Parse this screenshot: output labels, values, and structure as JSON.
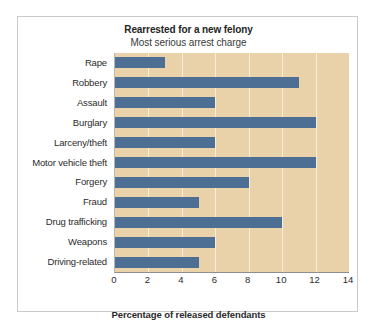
{
  "chart_data": {
    "type": "bar",
    "orientation": "horizontal",
    "title": "Rearrested for a new felony",
    "subtitle": "Most serious arrest charge",
    "xlabel": "Percentage of released defendants",
    "ylabel": "",
    "xlim": [
      0,
      14
    ],
    "xticks": [
      0,
      2,
      4,
      6,
      8,
      10,
      12,
      14
    ],
    "xtick_labels": [
      "0",
      "2",
      "4",
      "6",
      "8",
      "10",
      "12",
      "14"
    ],
    "grid": "vertical",
    "legend": "none",
    "categories": [
      "Rape",
      "Robbery",
      "Assault",
      "Burglary",
      "Larceny/theft",
      "Motor vehicle theft",
      "Forgery",
      "Fraud",
      "Drug trafficking",
      "Weapons",
      "Driving-related"
    ],
    "values": [
      3,
      11,
      6,
      12,
      6,
      12,
      8,
      5,
      10,
      6,
      5
    ],
    "bars": [
      {
        "category": "Rape",
        "value": 3
      },
      {
        "category": "Robbery",
        "value": 11
      },
      {
        "category": "Assault",
        "value": 6
      },
      {
        "category": "Burglary",
        "value": 12
      },
      {
        "category": "Larceny/theft",
        "value": 6
      },
      {
        "category": "Motor vehicle theft",
        "value": 12
      },
      {
        "category": "Forgery",
        "value": 8
      },
      {
        "category": "Fraud",
        "value": 5
      },
      {
        "category": "Drug trafficking",
        "value": 10
      },
      {
        "category": "Weapons",
        "value": 6
      },
      {
        "category": "Driving-related",
        "value": 5
      }
    ],
    "colors": {
      "bar": "#4d6f93",
      "plot_background": "#e9d1a9",
      "gridline": "#ffffff",
      "figure_background": "#ffffff",
      "figure_border": "#c9c9c9",
      "text": "#2b2b2b"
    }
  }
}
